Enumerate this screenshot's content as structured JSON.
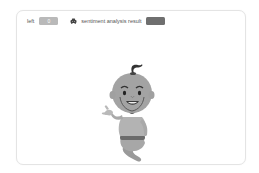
{
  "panel": {
    "left_label": "left",
    "left_value": "0",
    "result_icon": "robot-icon",
    "result_label": "sentiment analysis result",
    "result_value": ""
  },
  "illustration": {
    "name": "genie-character",
    "style": "grayscale"
  },
  "colors": {
    "card_border": "#e4e4e4",
    "left_badge": "#b9b9b9",
    "result_badge": "#6f6f6f",
    "text": "#555555"
  }
}
